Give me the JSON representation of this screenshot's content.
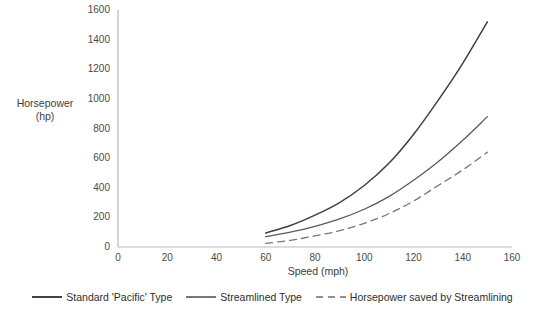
{
  "chart_data": {
    "type": "line",
    "title": "",
    "xlabel": "Speed (mph)",
    "ylabel": "Horsepower (hp)",
    "ylabel_line1": "Horsepower",
    "ylabel_line2": "(hp)",
    "xlim": [
      0,
      160
    ],
    "ylim": [
      0,
      1600
    ],
    "xticks": [
      "0",
      "20",
      "40",
      "60",
      "80",
      "100",
      "120",
      "140",
      "160"
    ],
    "yticks": [
      "0",
      "200",
      "400",
      "600",
      "800",
      "1000",
      "1200",
      "1400",
      "1600"
    ],
    "grid": false,
    "legend_position": "bottom",
    "x": [
      60,
      70,
      80,
      90,
      100,
      110,
      120,
      130,
      140,
      150
    ],
    "series": [
      {
        "name": "Standard 'Pacific' Type",
        "style": "solid",
        "color": "#404040",
        "values": [
          95,
          145,
          215,
          300,
          415,
          565,
          760,
          990,
          1240,
          1520
        ]
      },
      {
        "name": "Streamlined Type",
        "style": "solid",
        "color": "#5a5a5a",
        "values": [
          70,
          100,
          140,
          190,
          255,
          340,
          450,
          575,
          720,
          880
        ]
      },
      {
        "name": "Horsepower saved by Streamlining",
        "style": "dashed",
        "color": "#767676",
        "values": [
          25,
          45,
          75,
          110,
          160,
          225,
          310,
          415,
          520,
          640
        ]
      }
    ]
  },
  "legend": {
    "items": [
      {
        "label": "Standard 'Pacific' Type",
        "style": "solid",
        "color": "#2f2f2f"
      },
      {
        "label": "Streamlined Type",
        "style": "solid",
        "color": "#4a4a4a"
      },
      {
        "label": "Horsepower saved by Streamlining",
        "style": "dashed",
        "color": "#6e6e6e"
      }
    ]
  },
  "axes": {
    "axis_color": "#b9b9b9"
  }
}
